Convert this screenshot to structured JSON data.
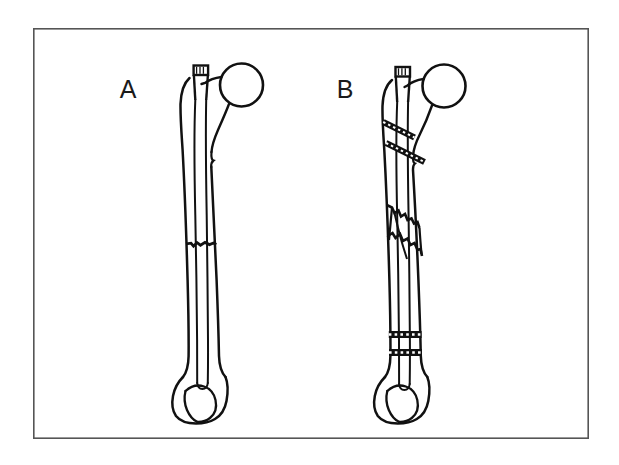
{
  "figure": {
    "background_color": "#ffffff",
    "ink_color": "#111111",
    "frame": {
      "name": "figure-border",
      "color": "#555555",
      "x": 33,
      "y": 28,
      "width": 556,
      "height": 411,
      "stroke_width": 1.6
    },
    "panels": [
      {
        "id": "panel-a",
        "label": "A",
        "label_x": 128,
        "label_y": 98,
        "caption": "Femur with intramedullary nail and transverse midshaft fracture",
        "fracture_type": "transverse",
        "fracture_count": 1,
        "cerclage_band_count": 0
      },
      {
        "id": "panel-b",
        "label": "B",
        "label_x": 345,
        "label_y": 98,
        "caption": "Femur with intramedullary nail, comminuted fracture and cerclage bands",
        "fracture_type": "comminuted",
        "fracture_count": 1,
        "cerclage_band_count": 4
      }
    ],
    "anatomy_parts": [
      "femoral-head",
      "femoral-neck",
      "greater-trochanter",
      "femoral-shaft",
      "medullary-canal",
      "distal-femoral-condyles",
      "intercondylar-notch"
    ],
    "implant_parts": [
      "intramedullary-nail",
      "nail-proximal-end",
      "cerclage-band"
    ],
    "cerclage_bands": [
      {
        "id": "band-proximal-1",
        "position": "proximal-upper",
        "orientation": "oblique"
      },
      {
        "id": "band-proximal-2",
        "position": "proximal-lower",
        "orientation": "oblique"
      },
      {
        "id": "band-distal-1",
        "position": "distal-upper",
        "orientation": "horizontal"
      },
      {
        "id": "band-distal-2",
        "position": "distal-lower",
        "orientation": "horizontal"
      }
    ]
  }
}
